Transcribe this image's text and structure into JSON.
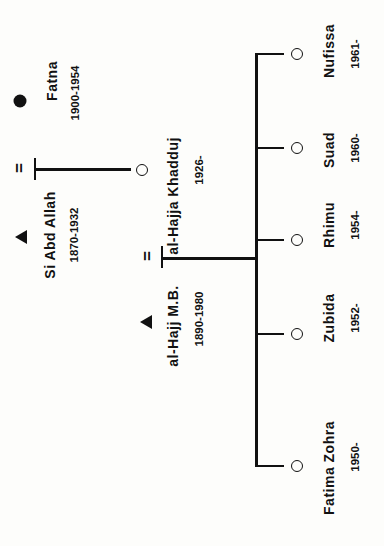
{
  "diagram": {
    "type": "genealogy",
    "orientation": "rotated 90 degrees counter-clockwise",
    "legend_symbols": {
      "male": "filled triangle",
      "female_deceased": "filled circle",
      "female": "open circle",
      "marriage": "="
    },
    "generation1": {
      "husband": {
        "name": "Si Abd Allah",
        "dates": "1870-1932",
        "symbol": "triangle"
      },
      "wife": {
        "name": "Fatna",
        "dates": "1900-1954",
        "symbol": "filled-circle"
      },
      "marriage_symbol": "="
    },
    "generation2": {
      "husband": {
        "name": "al-Hajj M.B.",
        "dates": "1890-1980",
        "symbol": "triangle"
      },
      "wife": {
        "name": "al-Hajja Khadduj",
        "dates": "1926-",
        "symbol": "open-circle"
      },
      "marriage_symbol": "="
    },
    "children": [
      {
        "name": "Fatima Zohra",
        "dates": "1950-",
        "symbol": "open-circle"
      },
      {
        "name": "Zubida",
        "dates": "1952-",
        "symbol": "open-circle"
      },
      {
        "name": "Rhimu",
        "dates": "1954-",
        "symbol": "open-circle"
      },
      {
        "name": "Suad",
        "dates": "1960-",
        "symbol": "open-circle"
      },
      {
        "name": "Nufissa",
        "dates": "1961-",
        "symbol": "open-circle"
      }
    ]
  }
}
